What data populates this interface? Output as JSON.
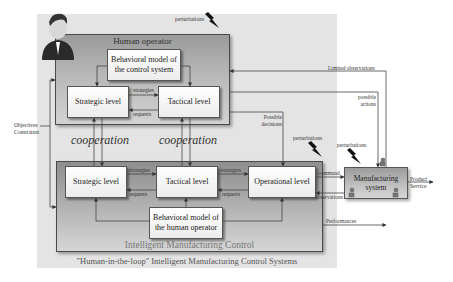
{
  "diagram": {
    "caption": "\"Human-in-the-loop\" Intelligent Manufacturing Control Systems",
    "human_operator": {
      "title": "Human operator",
      "behavioral_model": "Behavioral model of the control system",
      "strategic": "Strategic level",
      "tactical": "Tactical level",
      "label_strategies": "strategies",
      "label_requests": "requests"
    },
    "cooperation": [
      "cooperation",
      "cooperation"
    ],
    "imc": {
      "title": "Intelligent Manufacturing Control",
      "strategic": "Strategic level",
      "tactical": "Tactical level",
      "operational": "Operational level",
      "behavioral_model": "Behavioral model of the human operator",
      "label_strategies_1": "strategies",
      "label_requests_1": "requests",
      "label_strategies_2": "strategies",
      "label_requests_2": "requests"
    },
    "manufacturing_system": "Manufacturing system",
    "labels": {
      "objectives": "Objectives",
      "constraints": "Constraints",
      "perturbations_top": "perturbations",
      "perturbations_mid": "perturbations",
      "perturbations_mfg": "perturbations",
      "limited_observations": "Limited observations",
      "possible_actions_1": "possible",
      "possible_actions_2": "actions",
      "possible_decisions_1": "Possible",
      "possible_decisions_2": "decisions",
      "command": "command",
      "observations": "observations",
      "product": "Product",
      "service": "Service",
      "performances": "Performances"
    },
    "colors": {
      "background_panel": "#e4e4e4",
      "group_fill": "#a8a8a8",
      "box_fill": "#f4f4f4",
      "line": "#444444"
    }
  }
}
